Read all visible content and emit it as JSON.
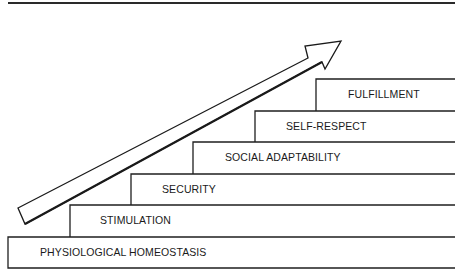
{
  "diagram": {
    "type": "staircase",
    "steps": [
      {
        "label": "PHYSIOLOGICAL HOMEOSTASIS"
      },
      {
        "label": "STIMULATION"
      },
      {
        "label": "SECURITY"
      },
      {
        "label": "SOCIAL ADAPTABILITY"
      },
      {
        "label": "SELF-RESPECT"
      },
      {
        "label": "FULFILLMENT"
      }
    ],
    "arrow_direction": "up-right",
    "colors": {
      "line": "#1a1a1a",
      "background": "#ffffff"
    }
  }
}
